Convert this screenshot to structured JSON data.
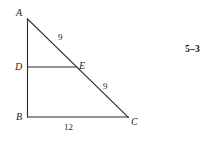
{
  "figure": {
    "number": "5–3",
    "background_color": "#ffffff",
    "stroke_color": "#2a2a2a",
    "text_color": "#1b1b1b",
    "vertices": [
      {
        "name": "A",
        "label": "A",
        "x": 27,
        "y": 19
      },
      {
        "name": "B",
        "label": "B",
        "x": 28,
        "y": 117
      },
      {
        "name": "C",
        "label": "C",
        "x": 128,
        "y": 117
      },
      {
        "name": "D",
        "label": "D",
        "x": 28,
        "y": 67
      },
      {
        "name": "E",
        "label": "E",
        "x": 75,
        "y": 67
      }
    ],
    "segments": [
      {
        "name": "side-AB",
        "from": "A",
        "to": "B"
      },
      {
        "name": "side-BC",
        "from": "B",
        "to": "C"
      },
      {
        "name": "side-AC",
        "from": "A",
        "to": "C"
      },
      {
        "name": "segment-DE",
        "from": "D",
        "to": "E"
      }
    ],
    "measures": [
      {
        "name": "length-AE",
        "segment": "AE",
        "value": "9"
      },
      {
        "name": "length-EC",
        "segment": "EC",
        "value": "9"
      },
      {
        "name": "length-BC",
        "segment": "BC",
        "value": "12"
      }
    ]
  }
}
